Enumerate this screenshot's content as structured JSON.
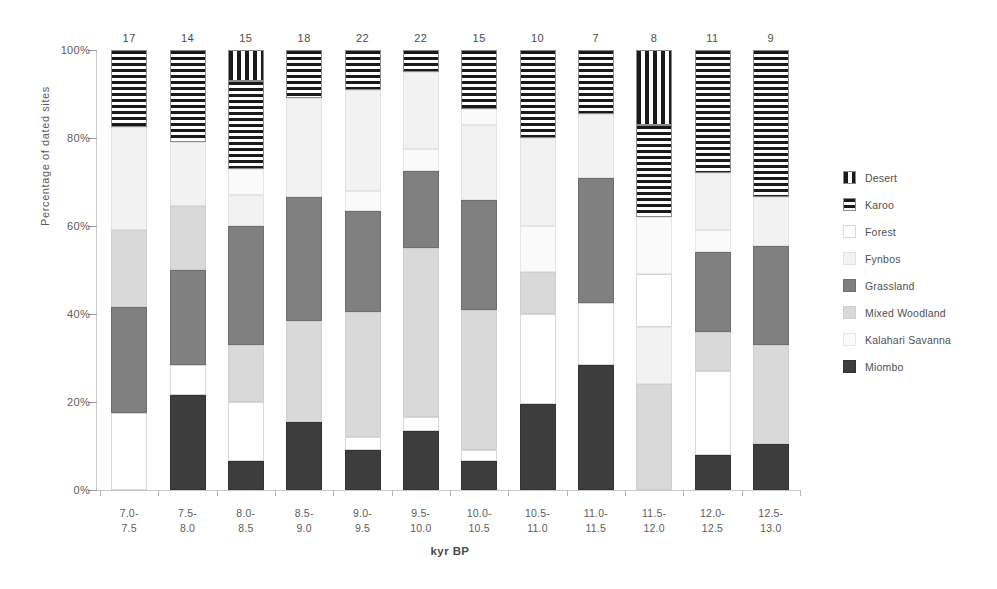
{
  "chart_data": {
    "type": "bar",
    "subtype": "stacked-percentage",
    "title": "",
    "xlabel": "kyr BP",
    "ylabel": "Percentage of dated sites",
    "ylim": [
      0,
      100
    ],
    "ytick_labels": [
      "0%",
      "20%",
      "40%",
      "60%",
      "80%",
      "100%"
    ],
    "ytick_values": [
      0,
      20,
      40,
      60,
      80,
      100
    ],
    "grid": false,
    "legend_position": "right",
    "categories": [
      "7.0-7.5",
      "7.5-8.0",
      "8.0-8.5",
      "8.5-9.0",
      "9.0-9.5",
      "9.5-10.0",
      "10.0-10.5",
      "10.5-11.0",
      "11.0-11.5",
      "11.5-12.0",
      "12.0-12.5",
      "12.5-13.0"
    ],
    "category_labels": [
      {
        "line1": "7.0-",
        "line2": "7.5"
      },
      {
        "line1": "7.5-",
        "line2": "8.0"
      },
      {
        "line1": "8.0-",
        "line2": "8.5"
      },
      {
        "line1": "8.5-",
        "line2": "9.0"
      },
      {
        "line1": "9.0-",
        "line2": "9.5"
      },
      {
        "line1": "9.5-",
        "line2": "10.0"
      },
      {
        "line1": "10.0-",
        "line2": "10.5"
      },
      {
        "line1": "10.5-",
        "line2": "11.0"
      },
      {
        "line1": "11.0-",
        "line2": "11.5"
      },
      {
        "line1": "11.5-",
        "line2": "12.0"
      },
      {
        "line1": "12.0-",
        "line2": "12.5"
      },
      {
        "line1": "12.5-",
        "line2": "13.0"
      }
    ],
    "bar_counts": [
      17,
      14,
      15,
      18,
      22,
      22,
      15,
      10,
      7,
      8,
      11,
      9
    ],
    "series": [
      {
        "name": "Miombo",
        "key": "miombo",
        "fill": "solid-dark",
        "color": "#3d3d3d",
        "values": [
          0,
          21.5,
          6.5,
          15.5,
          9,
          13.5,
          6.5,
          19.5,
          28.5,
          0,
          8,
          10.5
        ]
      },
      {
        "name": "Kalahari Savanna",
        "key": "kalahari",
        "fill": "solid-near-white",
        "color": "#fafafa",
        "values": [
          0,
          0,
          6,
          0,
          4.5,
          5,
          3.5,
          10.5,
          0,
          0,
          5,
          0
        ]
      },
      {
        "name": "Mixed Woodland",
        "key": "mixed",
        "fill": "solid-light-gray",
        "color": "#d9d9d9",
        "values": [
          17.5,
          14.5,
          13,
          23,
          28.5,
          38.5,
          32,
          9.5,
          0,
          24,
          9,
          22.5
        ]
      },
      {
        "name": "Grassland",
        "key": "grass",
        "fill": "solid-mid-gray",
        "color": "#808080",
        "values": [
          24,
          21.5,
          27,
          28,
          23,
          17.5,
          25,
          0,
          28.5,
          0,
          18,
          22.5
        ]
      },
      {
        "name": "Fynbos",
        "key": "fynbos",
        "fill": "solid-very-light",
        "color": "#f2f2f2",
        "values": [
          41,
          14.5,
          7,
          22.5,
          23,
          17.5,
          17,
          20,
          14.5,
          13,
          13,
          11
        ]
      },
      {
        "name": "Forest",
        "key": "forest",
        "fill": "solid-white",
        "color": "#ffffff",
        "values": [
          0,
          7,
          13.5,
          0,
          3,
          3,
          2.5,
          20.5,
          14,
          12,
          19,
          0
        ]
      },
      {
        "name": "Karoo",
        "key": "karoo",
        "fill": "horizontal-stripes",
        "color": "#1a1a1a",
        "values": [
          17.5,
          21,
          20,
          11,
          9,
          5,
          13.5,
          20,
          14.5,
          21,
          28,
          33.5
        ]
      },
      {
        "name": "Desert",
        "key": "desert",
        "fill": "vertical-stripes",
        "color": "#1a1a1a",
        "values": [
          0,
          0,
          7,
          0,
          0,
          0,
          0,
          0,
          0,
          17,
          0,
          0
        ]
      }
    ],
    "stacks": [
      {
        "category": "7.0-7.5",
        "count": 17,
        "segments": [
          {
            "key": "forest",
            "value": 17.5
          },
          {
            "key": "grass",
            "value": 24
          },
          {
            "key": "mixed",
            "value": 17.5
          },
          {
            "key": "fynbos",
            "value": 23.5
          },
          {
            "key": "karoo",
            "value": 17.5
          }
        ]
      },
      {
        "category": "7.5-8.0",
        "count": 14,
        "segments": [
          {
            "key": "miombo",
            "value": 21.5
          },
          {
            "key": "forest",
            "value": 7
          },
          {
            "key": "grass",
            "value": 21.5
          },
          {
            "key": "mixed",
            "value": 14.5
          },
          {
            "key": "fynbos",
            "value": 14.5
          },
          {
            "key": "karoo",
            "value": 21
          }
        ]
      },
      {
        "category": "8.0-8.5",
        "count": 15,
        "segments": [
          {
            "key": "miombo",
            "value": 6.5
          },
          {
            "key": "forest",
            "value": 13.5
          },
          {
            "key": "mixed",
            "value": 13
          },
          {
            "key": "grass",
            "value": 27
          },
          {
            "key": "fynbos",
            "value": 7
          },
          {
            "key": "kalahari",
            "value": 6
          },
          {
            "key": "karoo",
            "value": 20
          },
          {
            "key": "desert",
            "value": 7
          }
        ]
      },
      {
        "category": "8.5-9.0",
        "count": 18,
        "segments": [
          {
            "key": "miombo",
            "value": 15.5
          },
          {
            "key": "mixed",
            "value": 23
          },
          {
            "key": "grass",
            "value": 28
          },
          {
            "key": "fynbos",
            "value": 22.5
          },
          {
            "key": "karoo",
            "value": 11
          }
        ]
      },
      {
        "category": "9.0-9.5",
        "count": 22,
        "segments": [
          {
            "key": "miombo",
            "value": 9
          },
          {
            "key": "forest",
            "value": 3
          },
          {
            "key": "mixed",
            "value": 28.5
          },
          {
            "key": "grass",
            "value": 23
          },
          {
            "key": "kalahari",
            "value": 4.5
          },
          {
            "key": "fynbos",
            "value": 23
          },
          {
            "key": "karoo",
            "value": 9
          }
        ]
      },
      {
        "category": "9.5-10.0",
        "count": 22,
        "segments": [
          {
            "key": "miombo",
            "value": 13.5
          },
          {
            "key": "forest",
            "value": 3
          },
          {
            "key": "mixed",
            "value": 38.5
          },
          {
            "key": "grass",
            "value": 17.5
          },
          {
            "key": "kalahari",
            "value": 5
          },
          {
            "key": "fynbos",
            "value": 17.5
          },
          {
            "key": "karoo",
            "value": 5
          }
        ]
      },
      {
        "category": "10.0-10.5",
        "count": 15,
        "segments": [
          {
            "key": "miombo",
            "value": 6.5
          },
          {
            "key": "forest",
            "value": 2.5
          },
          {
            "key": "mixed",
            "value": 32
          },
          {
            "key": "grass",
            "value": 25
          },
          {
            "key": "fynbos",
            "value": 17
          },
          {
            "key": "kalahari",
            "value": 3.5
          },
          {
            "key": "karoo",
            "value": 13.5
          }
        ]
      },
      {
        "category": "10.5-11.0",
        "count": 10,
        "segments": [
          {
            "key": "miombo",
            "value": 19.5
          },
          {
            "key": "forest",
            "value": 20.5
          },
          {
            "key": "mixed",
            "value": 9.5
          },
          {
            "key": "kalahari",
            "value": 10.5
          },
          {
            "key": "fynbos",
            "value": 20
          },
          {
            "key": "karoo",
            "value": 20
          }
        ]
      },
      {
        "category": "11.0-11.5",
        "count": 7,
        "segments": [
          {
            "key": "miombo",
            "value": 28.5
          },
          {
            "key": "forest",
            "value": 14
          },
          {
            "key": "grass",
            "value": 28.5
          },
          {
            "key": "fynbos",
            "value": 14.5
          },
          {
            "key": "karoo",
            "value": 14.5
          }
        ]
      },
      {
        "category": "11.5-12.0",
        "count": 8,
        "segments": [
          {
            "key": "mixed",
            "value": 24
          },
          {
            "key": "fynbos",
            "value": 13
          },
          {
            "key": "forest",
            "value": 12
          },
          {
            "key": "kalahari",
            "value": 13
          },
          {
            "key": "karoo",
            "value": 21
          },
          {
            "key": "desert",
            "value": 17
          }
        ]
      },
      {
        "category": "12.0-12.5",
        "count": 11,
        "segments": [
          {
            "key": "miombo",
            "value": 8
          },
          {
            "key": "forest",
            "value": 19
          },
          {
            "key": "mixed",
            "value": 9
          },
          {
            "key": "grass",
            "value": 18
          },
          {
            "key": "kalahari",
            "value": 5
          },
          {
            "key": "fynbos",
            "value": 13
          },
          {
            "key": "karoo",
            "value": 28
          }
        ]
      },
      {
        "category": "12.5-13.0",
        "count": 9,
        "segments": [
          {
            "key": "miombo",
            "value": 10.5
          },
          {
            "key": "mixed",
            "value": 22.5
          },
          {
            "key": "grass",
            "value": 22.5
          },
          {
            "key": "fynbos",
            "value": 11
          },
          {
            "key": "karoo",
            "value": 33.5
          }
        ]
      }
    ],
    "legend": [
      {
        "label": "Desert",
        "key": "desert",
        "swatch": "vertical-stripes"
      },
      {
        "label": "Karoo",
        "key": "karoo",
        "swatch": "horizontal-stripes"
      },
      {
        "label": "Forest",
        "key": "forest",
        "swatch": "solid-white"
      },
      {
        "label": "Fynbos",
        "key": "fynbos",
        "swatch": "solid-very-light"
      },
      {
        "label": "Grassland",
        "key": "grass",
        "swatch": "solid-mid-gray"
      },
      {
        "label": "Mixed Woodland",
        "key": "mixed",
        "swatch": "solid-light-gray"
      },
      {
        "label": "Kalahari Savanna",
        "key": "kalahari",
        "swatch": "solid-near-white"
      },
      {
        "label": "Miombo",
        "key": "miombo",
        "swatch": "solid-dark"
      }
    ]
  }
}
